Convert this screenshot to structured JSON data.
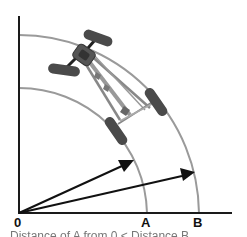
{
  "diagram": {
    "type": "turning-vehicle-radii",
    "origin_label": "0",
    "arc_labels": [
      "A",
      "B"
    ],
    "arcs": [
      {
        "label": "A",
        "radius_px": 128,
        "color": "#9a9a9a"
      },
      {
        "label": "B",
        "radius_px": 180,
        "color": "#9a9a9a"
      }
    ],
    "arrows": [
      {
        "to_arc": "A",
        "color": "#111111"
      },
      {
        "to_arc": "B",
        "color": "#111111"
      }
    ],
    "colors": {
      "axis": "#1a1a1a",
      "arc": "#9a9a9a",
      "wheel": "#4a4a4a",
      "chassis": "#8a8a8a"
    }
  },
  "labels": {
    "origin": "0",
    "a": "A",
    "b": "B"
  },
  "caption": "Distance of A from 0 < Distance B"
}
